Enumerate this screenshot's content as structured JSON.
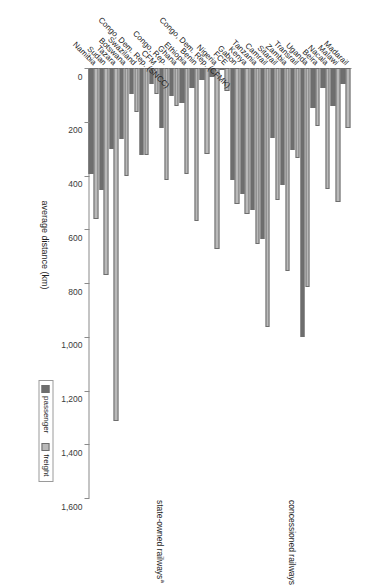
{
  "chart_data": {
    "type": "bar",
    "orientation": "vertical-grouped",
    "title": "",
    "xlabel": "",
    "ylabel": "average distance (km)",
    "ylim": [
      0,
      1600
    ],
    "ytick_step": 200,
    "ytick_labels": [
      "0",
      "200",
      "400",
      "600",
      "800",
      "1,000",
      "1,200",
      "1,400",
      "1,600"
    ],
    "grid": false,
    "legend_position": "bottom-right",
    "legend": [
      "passenger",
      "freight"
    ],
    "series": [
      {
        "name": "passenger",
        "color": "#6e6e6e",
        "values": [
          395,
          455,
          300,
          265,
          95,
          325,
          60,
          225,
          105,
          130,
          75,
          45,
          35,
          0,
          415,
          470,
          530,
          635,
          260,
          435,
          305,
          1000,
          150,
          75,
          140,
          60
        ]
      },
      {
        "name": "freight",
        "color": "#b9b9b9",
        "values": [
          560,
          770,
          1315,
          400,
          165,
          325,
          95,
          415,
          140,
          395,
          570,
          320,
          675,
          85,
          505,
          545,
          655,
          965,
          490,
          755,
          335,
          815,
          215,
          450,
          500,
          225
        ]
      }
    ],
    "categories": [
      "Namibia",
      "Sudan",
      "Tazara",
      "Botswana",
      "Swaziland",
      "Congo, Dem. Rep. (SNCC)",
      "CFM",
      "Congo, Rep.",
      "Ghana",
      "Ethiopia",
      "Benin",
      "Congo, Dem. Rep. (CFMK)",
      "Nigeria",
      "FCE",
      "Gabon",
      "Kenya",
      "Tanzania",
      "Camrail",
      "Sitarail",
      "Zambia",
      "Transrail",
      "Uganda",
      "Beira",
      "Nacala",
      "Malawi",
      "Madarail"
    ],
    "groups": [
      {
        "label": "state-owned railways",
        "superscript": "a",
        "start": 0,
        "end": 13
      },
      {
        "label": "concessioned railways",
        "superscript": "",
        "start": 14,
        "end": 25
      }
    ]
  }
}
